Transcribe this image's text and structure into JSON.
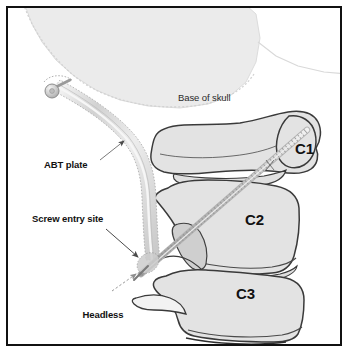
{
  "figure": {
    "kind": "medical-illustration",
    "frame_border_color": "#111111",
    "background_color": "#ffffff",
    "bone_fill_color": "#e3e3e3",
    "bone_outline_color": "#3a3a3a",
    "skull_fill_color": "#ebebeb",
    "hardware_fill_color": "#d9d9d9",
    "hardware_outline_color": "#8c8c8c",
    "leader_line_color": "#5a5a5a"
  },
  "labels": {
    "base_of_skull": "Base of skull",
    "abt_plate": "ABT plate",
    "screw_entry_site": "Screw entry site",
    "headless_screw_line1": "Headless",
    "headless_screw_line2": "screw"
  },
  "vertebrae": [
    {
      "id": "c1",
      "label": "C1"
    },
    {
      "id": "c2",
      "label": "C2"
    },
    {
      "id": "c3",
      "label": "C3"
    }
  ]
}
